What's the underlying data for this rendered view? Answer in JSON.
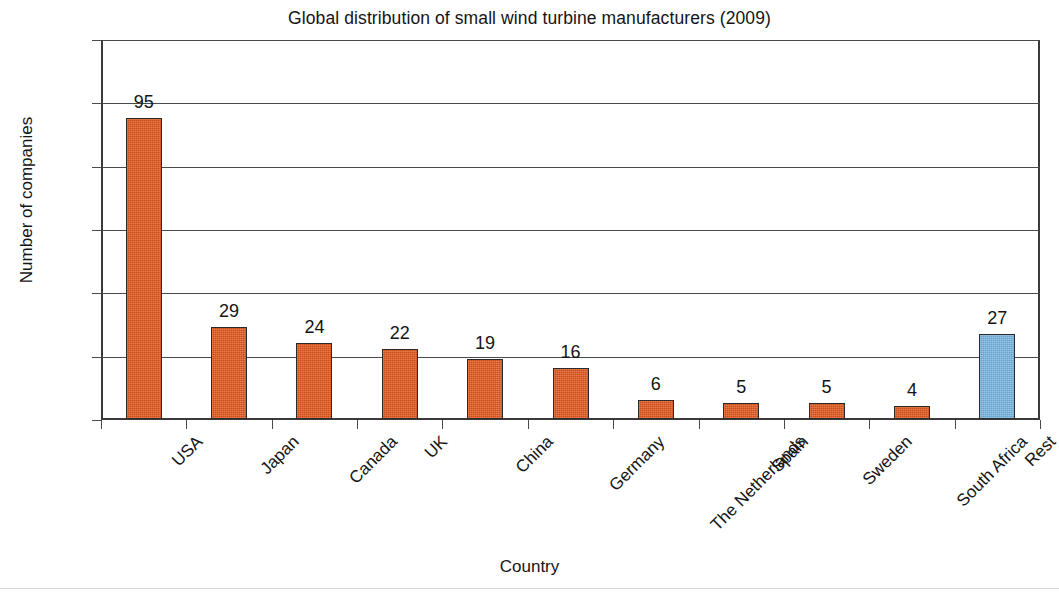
{
  "chart_data": {
    "type": "bar",
    "title": "Global distribution of small wind turbine manufacturers (2009)",
    "xlabel": "Country",
    "ylabel": "Number of companies",
    "categories": [
      "USA",
      "Japan",
      "Canada",
      "UK",
      "China",
      "Germany",
      "The Netherlands",
      "Spain",
      "Sweden",
      "South Africa",
      "Rest"
    ],
    "values": [
      95,
      29,
      24,
      22,
      19,
      16,
      6,
      5,
      5,
      4,
      27
    ],
    "value_labels": [
      "95",
      "29",
      "24",
      "22",
      "19",
      "16",
      "6",
      "5",
      "5",
      "4",
      "27"
    ],
    "bar_colors": [
      "#e0551a",
      "#e0551a",
      "#e0551a",
      "#e0551a",
      "#e0551a",
      "#e0551a",
      "#e0551a",
      "#e0551a",
      "#e0551a",
      "#e0551a",
      "#6fb0db"
    ],
    "ylim": [
      0,
      120
    ],
    "yticks": [
      0,
      20,
      40,
      60,
      80,
      100,
      120
    ],
    "ytick_labels": [
      "0",
      "20",
      "40",
      "60",
      "80",
      "100",
      "120"
    ],
    "grid": true,
    "grid_axis": "y",
    "legend": false,
    "data_labels": true,
    "xtick_label_rotation": -45,
    "accent_color": "#e0551a",
    "highlight_color": "#6fb0db",
    "axis_color": "#3a3a3a",
    "background_color": "#ffffff"
  }
}
